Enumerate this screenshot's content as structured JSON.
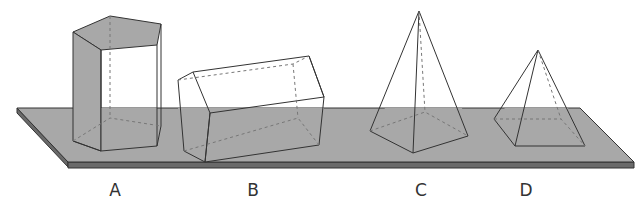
{
  "figure": {
    "colors": {
      "platform_top": "#a8a8a8",
      "platform_edge": "#6a6a6a",
      "outline": "#333333",
      "hidden_edge": "#777777",
      "shaded_face": "#a8a8a8",
      "background": "#ffffff"
    },
    "shapes": [
      {
        "id": "A",
        "label": "A",
        "type": "pentagonal prism (upright)",
        "label_x": 115
      },
      {
        "id": "B",
        "label": "B",
        "type": "pentagonal prism (lying on side)",
        "label_x": 253
      },
      {
        "id": "C",
        "label": "C",
        "type": "pentagonal pyramid",
        "label_x": 421
      },
      {
        "id": "D",
        "label": "D",
        "type": "square pyramid",
        "label_x": 526
      }
    ]
  }
}
